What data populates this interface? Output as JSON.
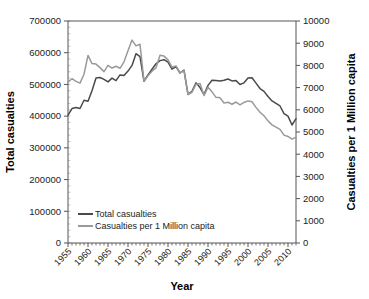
{
  "chart_data": {
    "type": "line",
    "title": "",
    "xlabel": "Year",
    "ylabel": "Total casualties",
    "y2label": "Casualties per 1 Million capita",
    "xlim": [
      1955,
      2012
    ],
    "ylim": [
      0,
      700000
    ],
    "y2lim": [
      0,
      10000
    ],
    "grid": false,
    "legend_position": "bottom-left",
    "x_tick_labels": [
      "1955",
      "1960",
      "1965",
      "1970",
      "1975",
      "1980",
      "1985",
      "1990",
      "1995",
      "2000",
      "2005",
      "2010"
    ],
    "x_tick_values": [
      1955,
      1960,
      1965,
      1970,
      1975,
      1980,
      1985,
      1990,
      1995,
      2000,
      2005,
      2010
    ],
    "x_minor_tick_step": 1,
    "y_tick_labels": [
      "0",
      "100000",
      "200000",
      "300000",
      "400000",
      "500000",
      "600000",
      "700000"
    ],
    "y_tick_values": [
      0,
      100000,
      200000,
      300000,
      400000,
      500000,
      600000,
      700000
    ],
    "y2_tick_labels": [
      "0",
      "1000",
      "2000",
      "3000",
      "4000",
      "5000",
      "6000",
      "7000",
      "8000",
      "9000",
      "10000"
    ],
    "y2_tick_values": [
      0,
      1000,
      2000,
      3000,
      4000,
      5000,
      6000,
      7000,
      8000,
      9000,
      10000
    ],
    "x": [
      1955,
      1956,
      1957,
      1958,
      1959,
      1960,
      1961,
      1962,
      1963,
      1964,
      1965,
      1966,
      1967,
      1968,
      1969,
      1970,
      1971,
      1972,
      1973,
      1974,
      1975,
      1976,
      1977,
      1978,
      1979,
      1980,
      1981,
      1982,
      1983,
      1984,
      1985,
      1986,
      1987,
      1988,
      1989,
      1990,
      1991,
      1992,
      1993,
      1994,
      1995,
      1996,
      1997,
      1998,
      1999,
      2000,
      2001,
      2002,
      2003,
      2004,
      2005,
      2006,
      2007,
      2008,
      2009,
      2010,
      2011,
      2012
    ],
    "series": [
      {
        "name": "Total casualties",
        "color": "#4a4a4a",
        "axis": "left",
        "values": [
          403000,
          424000,
          427000,
          424000,
          450000,
          447000,
          480000,
          520000,
          522000,
          516000,
          508000,
          520000,
          512000,
          530000,
          528000,
          542000,
          560000,
          597000,
          588000,
          510000,
          530000,
          548000,
          565000,
          575000,
          578000,
          570000,
          548000,
          556000,
          536000,
          545000,
          469000,
          478000,
          505000,
          490000,
          468000,
          497000,
          513000,
          512000,
          511000,
          513000,
          517000,
          511000,
          512000,
          500000,
          505000,
          520000,
          521000,
          504000,
          487000,
          478000,
          462000,
          448000,
          440000,
          432000,
          408000,
          400000,
          372000,
          392000
        ]
      },
      {
        "name": "Casualties per 1 Million capita",
        "color": "#9a9a9a",
        "axis": "right",
        "values": [
          7250,
          7400,
          7280,
          7200,
          7600,
          8450,
          8080,
          8060,
          7900,
          7720,
          8000,
          7880,
          7960,
          7870,
          8160,
          8660,
          9140,
          8880,
          8950,
          7290,
          7530,
          7740,
          7890,
          8460,
          8420,
          8250,
          7920,
          7980,
          7660,
          7760,
          6680,
          6790,
          7150,
          7180,
          6640,
          7020,
          6810,
          6560,
          6540,
          6310,
          6340,
          6250,
          6350,
          6220,
          6330,
          6400,
          6360,
          6110,
          5890,
          5730,
          5500,
          5320,
          5220,
          5120,
          4860,
          4800,
          4680,
          4770
        ]
      }
    ]
  },
  "axes": {
    "x_title": "Year",
    "y_left_title": "Total casualties",
    "y_right_title": "Casualties per 1 Million capita"
  },
  "legend": {
    "items": [
      {
        "label": "Total casualties",
        "color": "#4a4a4a"
      },
      {
        "label": "Casualties per 1 Million capita",
        "color": "#9a9a9a"
      }
    ]
  }
}
